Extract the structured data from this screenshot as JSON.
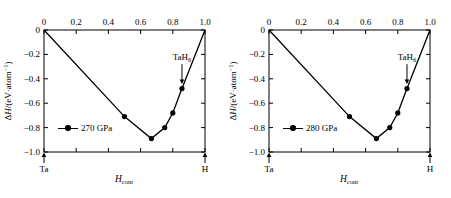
{
  "figure": {
    "panels": [
      {
        "id": "panel-270",
        "legend_label": "270 GPa",
        "annotation": {
          "text_main": "TaH",
          "text_sub": "6",
          "x": 0.857,
          "y": -0.3
        },
        "end_labels": {
          "left": "Ta",
          "right": "H"
        },
        "axis": {
          "xlabel_main": "H",
          "xlabel_sub": "cont",
          "ylabel_delta": "Δ",
          "ylabel_h": "H",
          "ylabel_rest": "/(eV·atom",
          "ylabel_sup": "−1",
          "ylabel_close": ")"
        },
        "chart_data": {
          "type": "line",
          "title": "",
          "xlabel": "H_cont",
          "ylabel": "ΔH/(eV·atom⁻¹)",
          "xlim": [
            0,
            1.0
          ],
          "ylim": [
            -1.0,
            0
          ],
          "xticks": [
            "0",
            "0.2",
            "0.4",
            "0.6",
            "0.8",
            "1.0"
          ],
          "xtick_values": [
            0,
            0.2,
            0.4,
            0.6,
            0.8,
            1.0
          ],
          "yticks": [
            "0",
            "−0.2",
            "−0.4",
            "−0.6",
            "−0.8",
            "−1.0"
          ],
          "ytick_values": [
            0,
            -0.2,
            -0.4,
            -0.6,
            -0.8,
            -1.0
          ],
          "xaxis_position": "top",
          "grid": false,
          "legend_position": "inside-left",
          "series": [
            {
              "name": "270 GPa",
              "marker": "filled-circle",
              "x": [
                0,
                0.5,
                0.667,
                0.75,
                0.8,
                0.857,
                1.0
              ],
              "y": [
                0,
                -0.71,
                -0.89,
                -0.8,
                -0.68,
                -0.48,
                0
              ]
            }
          ]
        }
      },
      {
        "id": "panel-280",
        "legend_label": "280 GPa",
        "annotation": {
          "text_main": "TaH",
          "text_sub": "6",
          "x": 0.857,
          "y": -0.3
        },
        "end_labels": {
          "left": "Ta",
          "right": "H"
        },
        "axis": {
          "xlabel_main": "H",
          "xlabel_sub": "cont",
          "ylabel_delta": "Δ",
          "ylabel_h": "H",
          "ylabel_rest": "/(eV·atom",
          "ylabel_sup": "−1",
          "ylabel_close": ")"
        },
        "chart_data": {
          "type": "line",
          "title": "",
          "xlabel": "H_cont",
          "ylabel": "ΔH/(eV·atom⁻¹)",
          "xlim": [
            0,
            1.0
          ],
          "ylim": [
            -1.0,
            0
          ],
          "xticks": [
            "0",
            "0.2",
            "0.4",
            "0.6",
            "0.8",
            "1.0"
          ],
          "xtick_values": [
            0,
            0.2,
            0.4,
            0.6,
            0.8,
            1.0
          ],
          "yticks": [
            "0",
            "−0.2",
            "−0.4",
            "−0.6",
            "−0.8",
            "−1.0"
          ],
          "ytick_values": [
            0,
            -0.2,
            -0.4,
            -0.6,
            -0.8,
            -1.0
          ],
          "xaxis_position": "top",
          "grid": false,
          "legend_position": "inside-left",
          "series": [
            {
              "name": "280 GPa",
              "marker": "filled-circle",
              "x": [
                0,
                0.5,
                0.667,
                0.75,
                0.8,
                0.857,
                1.0
              ],
              "y": [
                0,
                -0.71,
                -0.89,
                -0.8,
                -0.68,
                -0.48,
                0
              ]
            }
          ]
        }
      }
    ],
    "colors": {
      "line": "#000000",
      "marker": "#000000",
      "frame": "#000000",
      "background": "#ffffff"
    }
  }
}
